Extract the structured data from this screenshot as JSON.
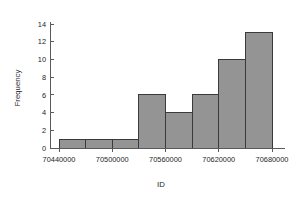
{
  "page": {
    "cut_caption": "",
    "background": "#ffffff"
  },
  "chart_data": {
    "type": "bar",
    "title": "",
    "xlabel": "ID",
    "ylabel": "Frequency",
    "categories": [
      "70440000-70470000",
      "70470000-70500000",
      "70500000-70530000",
      "70530000-70560000",
      "70560000-70590000",
      "70590000-70620000",
      "70620000-70650000",
      "70650000-70680000"
    ],
    "bin_edges": [
      70440000,
      70470000,
      70500000,
      70530000,
      70560000,
      70590000,
      70620000,
      70650000,
      70680000
    ],
    "bin_width": 30000,
    "values": [
      1,
      1,
      1,
      6,
      4,
      6,
      10,
      13
    ],
    "xlim": [
      70440000,
      70680000
    ],
    "ylim": [
      0,
      14
    ],
    "x_ticks": [
      70440000,
      70500000,
      70560000,
      70620000,
      70680000
    ],
    "x_tick_labels": [
      "70440000",
      "70500000",
      "70560000",
      "70620000",
      "70680000"
    ],
    "y_ticks": [
      0,
      2,
      4,
      6,
      8,
      10,
      12,
      14
    ],
    "y_tick_labels": [
      "0",
      "2",
      "4",
      "6",
      "8",
      "10",
      "12",
      "14"
    ],
    "grid": false,
    "legend": false,
    "bar_fill_color": "#949494",
    "bar_edge_color": "#3a3a3a",
    "axis_color": "#5a5a5a"
  }
}
